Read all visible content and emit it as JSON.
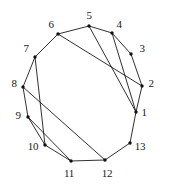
{
  "figure": {
    "type": "graph-drawing",
    "width": 171,
    "height": 190,
    "background_color": "#ffffff",
    "line_color": "#1a1a1a",
    "vertex_color": "#101010",
    "vertex_radius": 1.7,
    "label_font_size": 11
  },
  "chart_data": {
    "type": "scatter",
    "title": "",
    "xlabel": "",
    "ylabel": "",
    "grid": false,
    "legend": null,
    "xlim": [
      0,
      171
    ],
    "ylim": [
      0,
      190
    ],
    "graph": {
      "node_count": 13,
      "edge_count": 19,
      "layout": "circular",
      "center": [
        85,
        92
      ],
      "radius_x": 59,
      "radius_y": 64
    },
    "nodes": [
      {
        "id": "1",
        "label": "1",
        "x": 136,
        "y": 112,
        "label_x": 144,
        "label_y": 112
      },
      {
        "id": "2",
        "label": "2",
        "x": 142,
        "y": 86,
        "label_x": 151,
        "label_y": 83
      },
      {
        "id": "3",
        "label": "3",
        "x": 131,
        "y": 54,
        "label_x": 142,
        "label_y": 48
      },
      {
        "id": "4",
        "label": "4",
        "x": 112,
        "y": 33,
        "label_x": 119,
        "label_y": 24
      },
      {
        "id": "5",
        "label": "5",
        "x": 89,
        "y": 26,
        "label_x": 89,
        "label_y": 15
      },
      {
        "id": "6",
        "label": "6",
        "x": 58,
        "y": 34,
        "label_x": 51,
        "label_y": 24
      },
      {
        "id": "7",
        "label": "7",
        "x": 35,
        "y": 57,
        "label_x": 26,
        "label_y": 48
      },
      {
        "id": "8",
        "label": "8",
        "x": 23,
        "y": 87,
        "label_x": 14,
        "label_y": 83
      },
      {
        "id": "9",
        "label": "9",
        "x": 28,
        "y": 117,
        "label_x": 18,
        "label_y": 115
      },
      {
        "id": "10",
        "label": "10",
        "x": 45,
        "y": 145,
        "label_x": 33,
        "label_y": 146
      },
      {
        "id": "11",
        "label": "11",
        "x": 71,
        "y": 161,
        "label_x": 69,
        "label_y": 173
      },
      {
        "id": "12",
        "label": "12",
        "x": 105,
        "y": 160,
        "label_x": 107,
        "label_y": 173
      },
      {
        "id": "13",
        "label": "13",
        "x": 130,
        "y": 143,
        "label_x": 140,
        "label_y": 146
      }
    ],
    "edges": [
      {
        "from": "1",
        "to": "2",
        "kind": "perimeter"
      },
      {
        "from": "2",
        "to": "3",
        "kind": "perimeter"
      },
      {
        "from": "3",
        "to": "4",
        "kind": "perimeter"
      },
      {
        "from": "4",
        "to": "5",
        "kind": "perimeter"
      },
      {
        "from": "5",
        "to": "6",
        "kind": "perimeter"
      },
      {
        "from": "6",
        "to": "7",
        "kind": "perimeter"
      },
      {
        "from": "7",
        "to": "8",
        "kind": "perimeter"
      },
      {
        "from": "8",
        "to": "9",
        "kind": "perimeter"
      },
      {
        "from": "9",
        "to": "10",
        "kind": "perimeter"
      },
      {
        "from": "10",
        "to": "11",
        "kind": "perimeter"
      },
      {
        "from": "11",
        "to": "12",
        "kind": "perimeter"
      },
      {
        "from": "12",
        "to": "13",
        "kind": "perimeter"
      },
      {
        "from": "13",
        "to": "1",
        "kind": "perimeter"
      },
      {
        "from": "6",
        "to": "2",
        "kind": "chord"
      },
      {
        "from": "5",
        "to": "1",
        "kind": "chord"
      },
      {
        "from": "4",
        "to": "1",
        "kind": "chord"
      },
      {
        "from": "7",
        "to": "10",
        "kind": "chord"
      },
      {
        "from": "8",
        "to": "12",
        "kind": "chord"
      },
      {
        "from": "9",
        "to": "11",
        "kind": "chord"
      }
    ]
  }
}
